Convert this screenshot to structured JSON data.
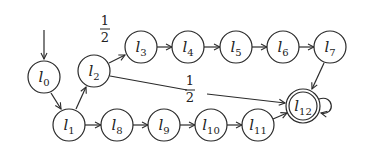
{
  "diagram": {
    "type": "state-machine",
    "initial_state": "l0",
    "accepting_states": [
      "l12"
    ],
    "nodes": [
      {
        "id": "l0",
        "base": "l",
        "sub": "0",
        "x": 44,
        "y": 77
      },
      {
        "id": "l1",
        "base": "l",
        "sub": "1",
        "x": 69,
        "y": 125
      },
      {
        "id": "l2",
        "base": "l",
        "sub": "2",
        "x": 94,
        "y": 71
      },
      {
        "id": "l3",
        "base": "l",
        "sub": "3",
        "x": 141,
        "y": 47
      },
      {
        "id": "l4",
        "base": "l",
        "sub": "4",
        "x": 188,
        "y": 47
      },
      {
        "id": "l5",
        "base": "l",
        "sub": "5",
        "x": 236,
        "y": 47
      },
      {
        "id": "l6",
        "base": "l",
        "sub": "6",
        "x": 283,
        "y": 47
      },
      {
        "id": "l7",
        "base": "l",
        "sub": "7",
        "x": 330,
        "y": 47
      },
      {
        "id": "l8",
        "base": "l",
        "sub": "8",
        "x": 117,
        "y": 125
      },
      {
        "id": "l9",
        "base": "l",
        "sub": "9",
        "x": 164,
        "y": 125
      },
      {
        "id": "l10",
        "base": "l",
        "sub": "10",
        "x": 211,
        "y": 125
      },
      {
        "id": "l11",
        "base": "l",
        "sub": "11",
        "x": 258,
        "y": 125
      },
      {
        "id": "l12",
        "base": "l",
        "sub": "12",
        "x": 303,
        "y": 106
      }
    ],
    "edges": [
      {
        "from": "l0",
        "to": "l1",
        "label": ""
      },
      {
        "from": "l1",
        "to": "l2",
        "label": ""
      },
      {
        "from": "l2",
        "to": "l3",
        "label": "1/2"
      },
      {
        "from": "l3",
        "to": "l4",
        "label": ""
      },
      {
        "from": "l4",
        "to": "l5",
        "label": ""
      },
      {
        "from": "l5",
        "to": "l6",
        "label": ""
      },
      {
        "from": "l6",
        "to": "l7",
        "label": ""
      },
      {
        "from": "l7",
        "to": "l12",
        "label": ""
      },
      {
        "from": "l2",
        "to": "l12",
        "label": "1/2"
      },
      {
        "from": "l1",
        "to": "l8",
        "label": ""
      },
      {
        "from": "l8",
        "to": "l9",
        "label": ""
      },
      {
        "from": "l9",
        "to": "l10",
        "label": ""
      },
      {
        "from": "l10",
        "to": "l11",
        "label": ""
      },
      {
        "from": "l11",
        "to": "l12",
        "label": ""
      },
      {
        "from": "l12",
        "to": "l12",
        "label": ""
      }
    ],
    "edge_labels": {
      "upper": {
        "numerator": "1",
        "denominator": "2"
      },
      "lower": {
        "numerator": "1",
        "denominator": "2"
      }
    }
  }
}
